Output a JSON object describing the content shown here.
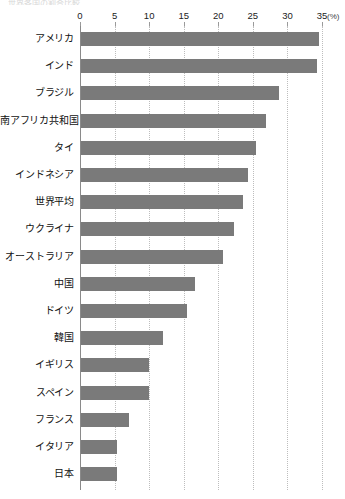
{
  "title_sliver": "世界各国の割合比較",
  "axis": {
    "unit": "(%)",
    "ticks": [
      0,
      5,
      10,
      15,
      20,
      25,
      30,
      35
    ],
    "tick_labels": [
      "0",
      "5",
      "10",
      "15",
      "20",
      "25",
      "30",
      "35"
    ]
  },
  "style": {
    "bar_color": "#7a7a7a",
    "gridline_color": "#bdbdbd",
    "axis_color": "#8a8a8a",
    "text_color": "#111111",
    "background": "#ffffff"
  },
  "chart_data": {
    "type": "bar",
    "orientation": "horizontal",
    "title": "",
    "xlabel": "(%)",
    "ylabel": "",
    "xlim": [
      0,
      35
    ],
    "grid": true,
    "legend": false,
    "categories": [
      "アメリカ",
      "インド",
      "ブラジル",
      "南アフリカ共和国",
      "タイ",
      "インドネシア",
      "世界平均",
      "ウクライナ",
      "オーストラリア",
      "中国",
      "ドイツ",
      "韓国",
      "イギリス",
      "スペイン",
      "フランス",
      "イタリア",
      "日本"
    ],
    "values": [
      34.4,
      34.1,
      28.6,
      26.8,
      25.3,
      24.2,
      23.4,
      22.2,
      20.5,
      16.5,
      15.3,
      11.9,
      9.8,
      9.8,
      7.0,
      5.2,
      5.2
    ],
    "xticks": [
      0,
      5,
      10,
      15,
      20,
      25,
      30,
      35
    ]
  }
}
